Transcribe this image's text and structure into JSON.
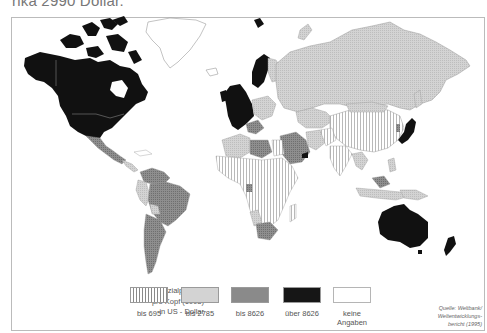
{
  "caption": {
    "text": "rika 2990 Dollar."
  },
  "map": {
    "title": "Bruttosozialprodukt pro Kopf (1993) in US-Dollar",
    "colors": {
      "bis_695": "#ffffff",
      "bis_2785": "#cfcfcf",
      "bis_8626": "#8c8c8c",
      "ueber_8626": "#111111",
      "keine_angaben": "#ffffff",
      "border": "#9a9a9a"
    }
  },
  "legend": {
    "title_lines": [
      "Bruttosozialprodukt",
      "pro Kopf (1993)",
      "in US - Dollar"
    ],
    "items": [
      {
        "label": "bis 695",
        "pattern": "vertical-stripes"
      },
      {
        "label": "bis 2785",
        "pattern": "light-gray-dots"
      },
      {
        "label": "bis 8626",
        "pattern": "dark-gray-dots"
      },
      {
        "label": "über 8626",
        "pattern": "black"
      },
      {
        "label_line1": "keine",
        "label_line2": "Angaben",
        "pattern": "white"
      }
    ]
  },
  "source": {
    "lines": [
      "Quelle: Weltbank/",
      "Weltentwicklungs-",
      "bericht (1995)"
    ]
  }
}
